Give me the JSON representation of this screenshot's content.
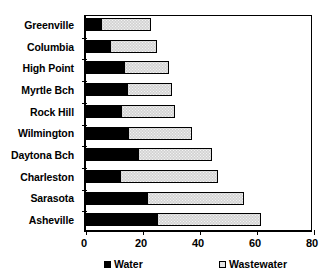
{
  "chart_data": {
    "type": "bar",
    "orientation": "horizontal",
    "stacked": true,
    "title": "",
    "xlabel": "",
    "ylabel": "",
    "xlim": [
      0,
      80
    ],
    "xticks": [
      0,
      20,
      40,
      60,
      80
    ],
    "xtick_labels": [
      "0",
      "20",
      "40",
      "60",
      "80"
    ],
    "grid": false,
    "legend_position": "bottom",
    "categories": [
      "Greenville",
      "Columbia",
      "High Point",
      "Myrtle Bch",
      "Rock Hill",
      "Wilmington",
      "Daytona Bch",
      "Charleston",
      "Sarasota",
      "Asheville"
    ],
    "series": [
      {
        "name": "Water",
        "color": "#000000",
        "values": [
          6,
          9,
          14,
          15,
          13,
          15.5,
          19,
          12.5,
          22,
          25.5
        ]
      },
      {
        "name": "Wastewater",
        "color": "#d4d4d4",
        "values": [
          17.5,
          16.5,
          16,
          16,
          19,
          22.5,
          26,
          34.5,
          34,
          36.5
        ]
      }
    ],
    "totals": [
      23.5,
      25.5,
      30,
      31,
      32,
      38,
      45,
      47,
      56,
      62
    ]
  },
  "legend": {
    "items": [
      {
        "label": "Water",
        "swatch": "filled-black-square"
      },
      {
        "label": "Wastewater",
        "swatch": "hollow-dotted-square"
      }
    ]
  }
}
